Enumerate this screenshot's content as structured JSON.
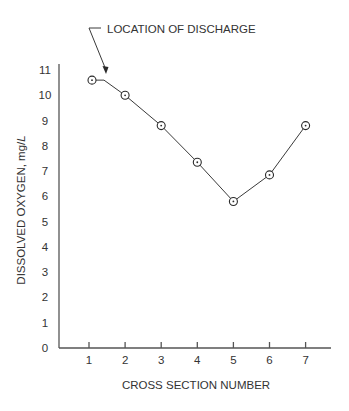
{
  "chart_data": {
    "type": "line",
    "title": "",
    "xlabel": "CROSS SECTION NUMBER",
    "ylabel": "DISSOLVED OXYGEN, mg/L",
    "ylabel_main": "DISSOLVED OXYGEN, mg/",
    "ylabel_unit_italic": "L",
    "x": [
      1,
      2,
      3,
      4,
      5,
      6,
      7
    ],
    "series": [
      {
        "name": "Dissolved Oxygen",
        "values": [
          10.6,
          10.0,
          8.8,
          7.35,
          5.8,
          6.85,
          8.8
        ]
      }
    ],
    "x_ticks": [
      "1",
      "2",
      "3",
      "4",
      "5",
      "6",
      "7"
    ],
    "y_ticks": [
      "0",
      "1",
      "2",
      "3",
      "4",
      "5",
      "6",
      "7",
      "8",
      "9",
      "10",
      "11"
    ],
    "ylim": [
      0,
      11
    ],
    "xlim": [
      0.2,
      7.7
    ],
    "grid": false,
    "legend": null,
    "annotations": [
      {
        "text": "LOCATION OF DISCHARGE",
        "points_to_x": 1.5,
        "points_to_y": 10.6
      }
    ],
    "marker": "circle-dot"
  }
}
